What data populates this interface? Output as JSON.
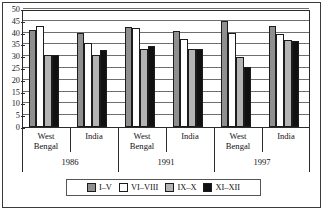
{
  "chart_data": {
    "type": "bar",
    "title": "",
    "subtitle": "",
    "xlabel": "",
    "ylabel": "",
    "ylim": [
      0,
      50
    ],
    "ytick_step": 5,
    "yticks": [
      "50",
      "45",
      "40",
      "35",
      "30",
      "25",
      "20",
      "15",
      "10",
      "5",
      "0"
    ],
    "grid": true,
    "legend_position": "bottom",
    "categories": [
      "West Bengal 1986",
      "India 1986",
      "West Bengal 1991",
      "India 1991",
      "West Bengal 1997",
      "India 1997"
    ],
    "region_labels": [
      "West Bengal",
      "India",
      "West Bengal",
      "India",
      "West Bengal",
      "India"
    ],
    "period_labels": [
      "1986",
      "1991",
      "1997"
    ],
    "series": [
      {
        "name": "I–V",
        "color": "#8f8f8f",
        "values": [
          41.0,
          40.0,
          42.5,
          40.5,
          45.0,
          43.0
        ]
      },
      {
        "name": "VI–VIII",
        "color": "#ffffff",
        "values": [
          43.0,
          35.5,
          42.0,
          37.5,
          40.0,
          39.5
        ]
      },
      {
        "name": "IX–X",
        "color": "#b4b4b4",
        "values": [
          30.5,
          30.5,
          33.0,
          33.0,
          29.5,
          37.0
        ]
      },
      {
        "name": "XI–XII",
        "color": "#111111",
        "values": [
          30.5,
          32.5,
          34.5,
          33.0,
          25.5,
          36.5
        ]
      }
    ]
  },
  "legend": {
    "items": [
      {
        "label": "I–V"
      },
      {
        "label": "VI–VIII"
      },
      {
        "label": "IX–X"
      },
      {
        "label": "XI–XII"
      }
    ]
  },
  "axis": {
    "period_1": "1986",
    "period_2": "1991",
    "period_3": "1997",
    "region_west_bengal_line1": "West",
    "region_west_bengal_line2": "Bengal",
    "region_india": "India"
  }
}
